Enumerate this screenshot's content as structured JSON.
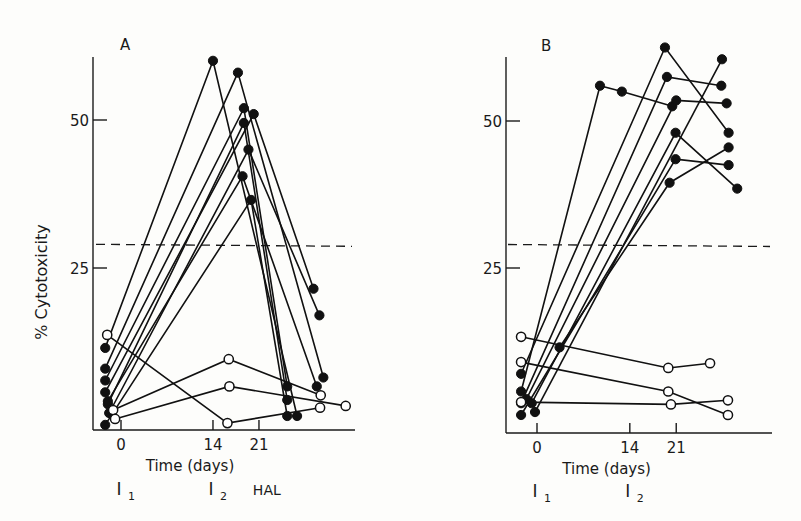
{
  "figure": {
    "ylabel": "% Cytotoxicity",
    "threshold_line_value": 29,
    "colors": {
      "ink": "#111111",
      "background": "#fdfdfb"
    }
  },
  "chart_data": [
    {
      "type": "line",
      "panel": "A",
      "title": "A",
      "xlabel": "Time (days)",
      "ylabel": "% Cytotoxicity",
      "x_ticks": [
        0,
        14,
        21
      ],
      "y_ticks": [
        25,
        50
      ],
      "ylim": [
        -2,
        60
      ],
      "xlim": [
        -4,
        34
      ],
      "grid": false,
      "threshold": 29,
      "annotations": [
        {
          "label": "I",
          "sub": "1",
          "x": 0
        },
        {
          "label": "I",
          "sub": "2",
          "x": 14
        },
        {
          "label": "HAL",
          "sub": "",
          "x": 22.5
        }
      ],
      "series": [
        {
          "name": "immunized-1",
          "marker": "filled",
          "points": [
            [
              -2.4,
              11.5
            ],
            [
              14,
              60
            ],
            [
              26.8,
              0
            ]
          ]
        },
        {
          "name": "immunized-2",
          "marker": "filled",
          "points": [
            [
              -2.4,
              8
            ],
            [
              17.8,
              58
            ],
            [
              30.8,
              6.5
            ]
          ]
        },
        {
          "name": "immunized-3",
          "marker": "filled",
          "points": [
            [
              -2.4,
              6
            ],
            [
              18.7,
              52
            ],
            [
              25.3,
              5
            ]
          ]
        },
        {
          "name": "immunized-4",
          "marker": "filled",
          "points": [
            [
              -2.4,
              4
            ],
            [
              20.2,
              51
            ],
            [
              29.3,
              21.5
            ]
          ]
        },
        {
          "name": "immunized-5",
          "marker": "filled",
          "points": [
            [
              -2,
              2
            ],
            [
              18.7,
              49.5
            ],
            [
              25.3,
              2.7
            ]
          ]
        },
        {
          "name": "immunized-6",
          "marker": "filled",
          "points": [
            [
              -1.8,
              0.5
            ],
            [
              19.4,
              45
            ],
            [
              30.2,
              17
            ]
          ]
        },
        {
          "name": "immunized-7",
          "marker": "filled",
          "points": [
            [
              -2,
              2.5
            ],
            [
              18.5,
              40.5
            ],
            [
              29.8,
              5
            ]
          ]
        },
        {
          "name": "immunized-8",
          "marker": "filled",
          "points": [
            [
              -2.4,
              -1.5
            ],
            [
              19.8,
              36.5
            ],
            [
              25.3,
              0
            ]
          ]
        },
        {
          "name": "control-1",
          "marker": "open",
          "points": [
            [
              -2.1,
              13.7
            ],
            [
              16.2,
              -1.2
            ],
            [
              30.3,
              1.4
            ]
          ]
        },
        {
          "name": "control-2",
          "marker": "open",
          "points": [
            [
              -1.2,
              1
            ],
            [
              16.4,
              9.6
            ],
            [
              30.4,
              3.5
            ]
          ]
        },
        {
          "name": "control-3",
          "marker": "open",
          "points": [
            [
              -0.9,
              -0.5
            ],
            [
              16.5,
              5
            ],
            [
              34.2,
              1.7
            ]
          ]
        }
      ]
    },
    {
      "type": "line",
      "panel": "B",
      "title": "B",
      "xlabel": "Time (days)",
      "ylabel": "% Cytotoxicity",
      "x_ticks": [
        0,
        14,
        21
      ],
      "y_ticks": [
        25,
        50
      ],
      "ylim": [
        -2,
        60
      ],
      "xlim": [
        -4,
        34
      ],
      "grid": false,
      "threshold": 29,
      "annotations": [
        {
          "label": "I",
          "sub": "1",
          "x": 0
        },
        {
          "label": "I",
          "sub": "2",
          "x": 14
        }
      ],
      "series": [
        {
          "name": "immunized-1",
          "marker": "filled",
          "points": [
            [
              -2.4,
              4
            ],
            [
              9.5,
              56
            ],
            [
              12.8,
              55
            ],
            [
              20.4,
              52.5
            ]
          ]
        },
        {
          "name": "immunized-2",
          "marker": "filled",
          "points": [
            [
              -2.4,
              7
            ],
            [
              19.3,
              62.5
            ],
            [
              28.9,
              48
            ]
          ]
        },
        {
          "name": "immunized-3",
          "marker": "filled",
          "points": [
            [
              -2.4,
              2
            ],
            [
              19.6,
              57.5
            ],
            [
              27.8,
              56
            ]
          ]
        },
        {
          "name": "immunized-4",
          "marker": "filled",
          "points": [
            [
              -1.6,
              2.7
            ],
            [
              21,
              53.5
            ],
            [
              28.6,
              53
            ]
          ]
        },
        {
          "name": "immunized-5",
          "marker": "filled",
          "points": [
            [
              -0.8,
              2
            ],
            [
              20.9,
              48
            ],
            [
              30.2,
              38.5
            ]
          ]
        },
        {
          "name": "immunized-6",
          "marker": "filled",
          "points": [
            [
              -2.4,
              0
            ],
            [
              20.9,
              43.5
            ],
            [
              28.9,
              42.5
            ]
          ]
        },
        {
          "name": "immunized-7",
          "marker": "filled",
          "points": [
            [
              3.4,
              11.5
            ],
            [
              20.0,
              39.5
            ],
            [
              28.9,
              45.5
            ]
          ]
        },
        {
          "name": "immunized-8",
          "marker": "filled",
          "points": [
            [
              -0.3,
              0.5
            ],
            [
              27.9,
              60.5
            ]
          ]
        },
        {
          "name": "control-1",
          "marker": "open",
          "points": [
            [
              -2.4,
              13.3
            ],
            [
              19.8,
              8
            ],
            [
              26.1,
              8.8
            ]
          ]
        },
        {
          "name": "control-2",
          "marker": "open",
          "points": [
            [
              -2.4,
              9
            ],
            [
              19.8,
              4
            ],
            [
              28.8,
              0
            ]
          ]
        },
        {
          "name": "control-3",
          "marker": "open",
          "points": [
            [
              -2.4,
              2.2
            ],
            [
              20.2,
              1.8
            ],
            [
              28.8,
              2.5
            ]
          ]
        }
      ]
    }
  ]
}
